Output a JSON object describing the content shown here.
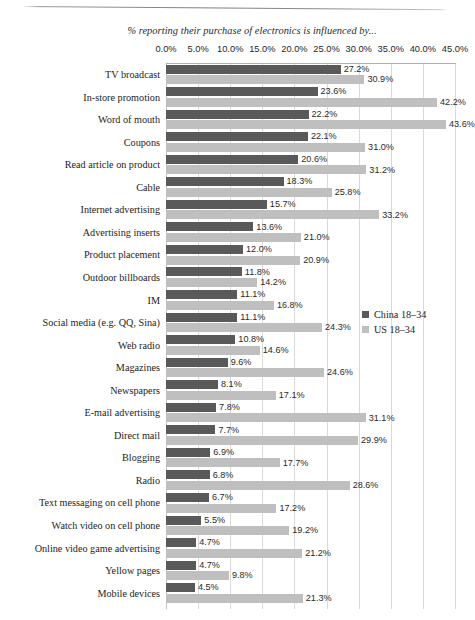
{
  "chart_data": {
    "type": "bar",
    "orientation": "horizontal",
    "title": "% reporting their purchase of electronics is influenced by...",
    "xlabel": "",
    "ylabel": "",
    "xlim": [
      0,
      45
    ],
    "xtick_step": 5,
    "xticks": [
      "0.0%",
      "5.0%",
      "10.0%",
      "15.0%",
      "20.0%",
      "25.0%",
      "30.0%",
      "35.0%",
      "40.0%",
      "45.0%"
    ],
    "grid": true,
    "legend_position": "right-middle",
    "categories": [
      "TV broadcast",
      "In-store promotion",
      "Word of mouth",
      "Coupons",
      "Read article on product",
      "Cable",
      "Internet advertising",
      "Advertising inserts",
      "Product placement",
      "Outdoor billboards",
      "IM",
      "Social media (e.g. QQ, Sina)",
      "Web radio",
      "Magazines",
      "Newspapers",
      "E-mail advertising",
      "Direct mail",
      "Blogging",
      "Radio",
      "Text messaging on cell phone",
      "Watch video on cell phone",
      "Online video game advertising",
      "Yellow pages",
      "Mobile devices"
    ],
    "series": [
      {
        "name": "China 18–34",
        "color": "#595959",
        "values": [
          27.2,
          23.6,
          22.2,
          22.1,
          20.6,
          18.3,
          15.7,
          13.6,
          12.0,
          11.8,
          11.1,
          11.1,
          10.8,
          9.6,
          8.1,
          7.8,
          7.7,
          6.9,
          6.8,
          6.7,
          5.5,
          4.7,
          4.7,
          4.5
        ],
        "labels": [
          "27.2%",
          "23.6%",
          "22.2%",
          "22.1%",
          "20.6%",
          "18.3%",
          "15.7%",
          "13.6%",
          "12.0%",
          "11.8%",
          "11.1%",
          "11.1%",
          "10.8%",
          "9.6%",
          "8.1%",
          "7.8%",
          "7.7%",
          "6.9%",
          "6.8%",
          "6.7%",
          "5.5%",
          "4.7%",
          "4.7%",
          "4.5%"
        ]
      },
      {
        "name": "US 18–34",
        "color": "#bfbfbf",
        "values": [
          30.9,
          42.2,
          43.6,
          31.0,
          31.2,
          25.8,
          33.2,
          21.0,
          20.9,
          14.2,
          16.8,
          24.3,
          14.6,
          24.6,
          17.1,
          31.1,
          29.9,
          17.7,
          28.6,
          17.2,
          19.2,
          21.2,
          9.8,
          21.3
        ],
        "labels": [
          "30.9%",
          "42.2%",
          "43.6%",
          "31.0%",
          "31.2%",
          "25.8%",
          "33.2%",
          "21.0%",
          "20.9%",
          "14.2%",
          "16.8%",
          "24.3%",
          "14.6%",
          "24.6%",
          "17.1%",
          "31.1%",
          "29.9%",
          "17.7%",
          "28.6%",
          "17.2%",
          "19.2%",
          "21.2%",
          "9.8%",
          "21.3%"
        ]
      }
    ]
  },
  "legend": {
    "items": [
      {
        "label": "China 18–34",
        "swatch": "china"
      },
      {
        "label": "US 18–34",
        "swatch": "us"
      }
    ]
  }
}
